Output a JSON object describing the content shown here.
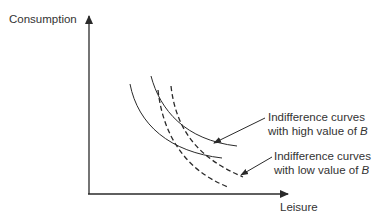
{
  "diagram": {
    "y_axis_label": "Consumption",
    "x_axis_label": "Leisure",
    "annotations": {
      "high": {
        "line1": "Indifference curves",
        "line2_prefix": "with high value of ",
        "variable": "B"
      },
      "low": {
        "line1": "Indifference curves",
        "line2_prefix": "with low value of ",
        "variable": "B"
      }
    },
    "curves": [
      {
        "name": "high-B-curve-1",
        "style": "solid"
      },
      {
        "name": "high-B-curve-2",
        "style": "solid"
      },
      {
        "name": "low-B-curve-1",
        "style": "dashed"
      },
      {
        "name": "low-B-curve-2",
        "style": "dashed"
      }
    ],
    "colors": {
      "line": "#2a2a2a",
      "text": "#333333",
      "background": "#ffffff"
    }
  }
}
